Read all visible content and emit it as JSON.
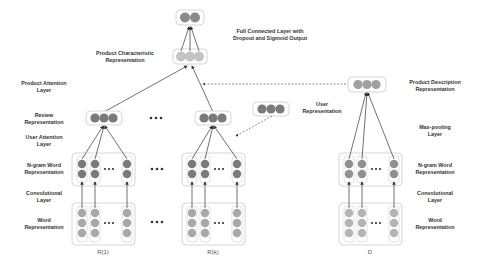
{
  "diagram": {
    "labels_left": {
      "product_attention": "Product Attention Layer",
      "review_rep": "Review Representation",
      "user_attention": "User Attention Layer",
      "ngram": "N-gram Word Representation",
      "conv": "Convolutional Layer",
      "word": "Word Representation"
    },
    "labels_top": {
      "product_char": "Product Characteristic Representation",
      "fc_line1": "Full Connected Layer with",
      "fc_line2": "Dropout and Sigmoid Output"
    },
    "labels_right": {
      "product_desc": "Product Description Representation",
      "maxpool": "Max-pooling Layer",
      "ngram": "N-gram Word Representation",
      "conv": "Convolutional Layer",
      "word": "Word Representation"
    },
    "user_rep": "User Representation",
    "captions": {
      "review_first": "R(1)",
      "review_last": "R(k)",
      "description": "D"
    },
    "colors": {
      "dark_node": "#7a7a7a",
      "light_node": "#a8a8a8",
      "pale_node": "#c8c8c8",
      "box_border": "#cfcfcf",
      "arrow": "#333333"
    }
  }
}
